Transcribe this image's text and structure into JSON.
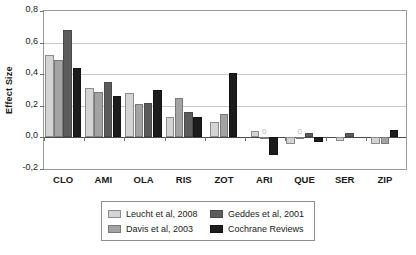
{
  "chart_data": {
    "type": "bar",
    "title": "",
    "xlabel": "",
    "ylabel": "Effect Size",
    "ylim": [
      -0.2,
      0.8
    ],
    "ytick_labels": [
      "0,8",
      "0,6",
      "0,4",
      "0,2",
      "0,0",
      "-0,2"
    ],
    "ytick_values": [
      0.8,
      0.6,
      0.4,
      0.2,
      0.0,
      -0.2
    ],
    "grid": true,
    "legend_position": "bottom",
    "decimal_separator": ",",
    "categories": [
      "CLO",
      "AMI",
      "OLA",
      "RIS",
      "ZOT",
      "ARI",
      "QUE",
      "SER",
      "ZIP"
    ],
    "series": [
      {
        "name": "Leucht et al, 2008",
        "color": "#d4d4d4",
        "values": [
          0.52,
          0.31,
          0.28,
          0.13,
          0.1,
          0.04,
          -0.04,
          -0.02,
          -0.04
        ]
      },
      {
        "name": "Davis et al, 2003",
        "color": "#a3a3a3",
        "values": [
          0.49,
          0.29,
          0.21,
          0.25,
          0.15,
          0.0,
          0.0,
          null,
          -0.04
        ]
      },
      {
        "name": "Geddes et al, 2001",
        "color": "#5c5c5c",
        "values": [
          0.68,
          0.35,
          0.22,
          0.16,
          null,
          null,
          0.03,
          0.03,
          null
        ]
      },
      {
        "name": "Cochrane Reviews",
        "color": "#1c1c1c",
        "values": [
          0.44,
          0.26,
          0.3,
          0.13,
          0.41,
          -0.11,
          -0.03,
          null,
          0.05
        ]
      }
    ],
    "zero_annotations": [
      {
        "category": "ARI",
        "series": "Davis et al, 2003",
        "label": "0"
      },
      {
        "category": "QUE",
        "series": "Davis et al, 2003",
        "label": "0"
      }
    ]
  },
  "legend": {
    "entries": [
      {
        "label": "Leucht et al, 2008",
        "swatch": "s0"
      },
      {
        "label": "Davis et al, 2003",
        "swatch": "s1"
      },
      {
        "label": "Geddes et al, 2001",
        "swatch": "s2"
      },
      {
        "label": "Cochrane Reviews",
        "swatch": "s3"
      }
    ]
  }
}
